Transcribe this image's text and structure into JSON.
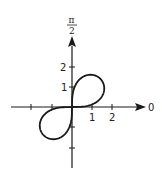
{
  "chart_data": {
    "type": "line",
    "subtype": "polar",
    "title": "",
    "equation": "r^2 = 4 sin 2θ",
    "polar_axis_labels": {
      "zero": "0",
      "pi_over_2_num": "π",
      "pi_over_2_den": "2"
    },
    "x_ticks": [
      {
        "value": -2,
        "label": ""
      },
      {
        "value": -1,
        "label": ""
      },
      {
        "value": 1,
        "label": "1"
      },
      {
        "value": 2,
        "label": "2"
      }
    ],
    "y_ticks": [
      {
        "value": -2,
        "label": ""
      },
      {
        "value": -1,
        "label": ""
      },
      {
        "value": 1,
        "label": "1"
      },
      {
        "value": 2,
        "label": "2"
      }
    ],
    "xlim": [
      -3,
      3.5
    ],
    "ylim": [
      -3,
      3.3
    ],
    "grid": false,
    "legend": null,
    "curve_color": "#1a1a1a",
    "axis_color": "#1a1a1a"
  }
}
